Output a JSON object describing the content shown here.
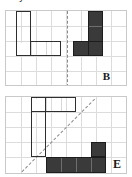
{
  "header": {
    "clipped_text": "...n you measure that"
  },
  "panels": [
    {
      "id": "panel-b",
      "label": "B",
      "mirror": "vertical",
      "grid": {
        "cols": 8,
        "rows": 5,
        "cell": 15
      },
      "shapes": [
        {
          "name": "preimage-shape-b",
          "style": "outline",
          "cells": [
            [
              0,
              0
            ],
            [
              0,
              1
            ],
            [
              0,
              2
            ],
            [
              1,
              2
            ],
            [
              2,
              2
            ]
          ]
        },
        {
          "name": "image-shape-b",
          "style": "filled",
          "fill": "#3a3a3a",
          "cells": [
            [
              1,
              0
            ],
            [
              1,
              1
            ],
            [
              0,
              2
            ],
            [
              1,
              2
            ]
          ]
        }
      ]
    },
    {
      "id": "panel-e",
      "label": "E",
      "mirror": "diagonal",
      "grid": {
        "cols": 8,
        "rows": 5,
        "cell": 15
      },
      "shapes": [
        {
          "name": "preimage-shape-e",
          "style": "outline",
          "cells": [
            [
              0,
              0
            ],
            [
              1,
              0
            ],
            [
              0,
              1
            ],
            [
              0,
              2
            ],
            [
              0,
              3
            ]
          ]
        },
        {
          "name": "image-shape-e",
          "style": "filled",
          "fill": "#3a3a3a",
          "cells": [
            [
              3,
              0
            ],
            [
              0,
              1
            ],
            [
              1,
              1
            ],
            [
              2,
              1
            ],
            [
              3,
              1
            ]
          ]
        }
      ]
    }
  ],
  "colors": {
    "fill_dark": "#3a3a3a",
    "outline": "#2e2e2e",
    "gridline": "#dcdcdc",
    "panel_border": "#c9c9c9",
    "mirror_line": "#8a8a8a",
    "background": "#ffffff"
  }
}
